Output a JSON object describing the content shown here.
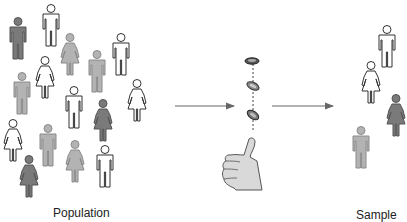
{
  "diagram": {
    "colors": {
      "white_fill": "#ffffff",
      "light_gray": "#b3b3b3",
      "mid_gray": "#9a9a9a",
      "dark_gray": "#7a7a7a",
      "outline": "#333333",
      "arrow": "#666666",
      "hand_fill": "#d9d9d9"
    },
    "population": {
      "label": "Population",
      "figures": [
        {
          "type": "man",
          "shade": "dark",
          "x": 18,
          "y": 17
        },
        {
          "type": "man",
          "shade": "white",
          "x": 51,
          "y": 4
        },
        {
          "type": "woman",
          "shade": "light",
          "x": 70,
          "y": 33
        },
        {
          "type": "man",
          "shade": "light",
          "x": 97,
          "y": 50
        },
        {
          "type": "man",
          "shade": "white",
          "x": 121,
          "y": 33
        },
        {
          "type": "woman",
          "shade": "white",
          "x": 45,
          "y": 56
        },
        {
          "type": "man",
          "shade": "light",
          "x": 22,
          "y": 72
        },
        {
          "type": "man",
          "shade": "white",
          "x": 74,
          "y": 86
        },
        {
          "type": "woman",
          "shade": "white",
          "x": 137,
          "y": 79
        },
        {
          "type": "woman",
          "shade": "dark",
          "x": 103,
          "y": 99
        },
        {
          "type": "woman",
          "shade": "white",
          "x": 13,
          "y": 119
        },
        {
          "type": "man",
          "shade": "light",
          "x": 48,
          "y": 124
        },
        {
          "type": "woman",
          "shade": "light",
          "x": 75,
          "y": 140
        },
        {
          "type": "man",
          "shade": "white",
          "x": 105,
          "y": 145
        },
        {
          "type": "woman",
          "shade": "dark",
          "x": 29,
          "y": 155
        }
      ]
    },
    "process": {
      "icon": "coin-flip-thumb",
      "coins": 3
    },
    "sample": {
      "label": "Sample",
      "figures": [
        {
          "type": "man",
          "shade": "white",
          "x": 387,
          "y": 25
        },
        {
          "type": "woman",
          "shade": "white",
          "x": 371,
          "y": 61
        },
        {
          "type": "woman",
          "shade": "dark",
          "x": 396,
          "y": 94
        },
        {
          "type": "man",
          "shade": "light",
          "x": 361,
          "y": 126
        }
      ]
    },
    "arrows": [
      {
        "from": "population",
        "to": "coin-flip",
        "x1": 175,
        "y1": 106,
        "x2": 234,
        "y2": 106
      },
      {
        "from": "coin-flip",
        "to": "sample",
        "x1": 272,
        "y1": 106,
        "x2": 333,
        "y2": 106
      }
    ]
  }
}
